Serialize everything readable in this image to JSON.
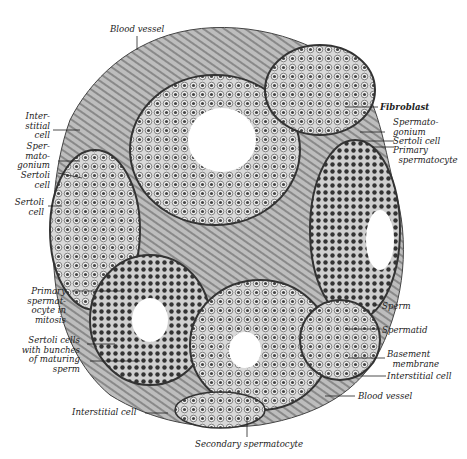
{
  "figure": {
    "labels": {
      "blood_vessel_top": "Blood vessel",
      "interstitial_cell_left": "Inter-\nstitial\ncell",
      "spermatogonium_left": "Sper-\nmato-\ngonium",
      "sertoli_cell_left_1": "Sertoli\ncell",
      "sertoli_cell_left_2": "Sertoli\ncell",
      "fibroblast": "Fibroblast",
      "spermatogonium_right": "Spermato-\ngonium",
      "sertoli_cell_right": "Sertoli cell",
      "primary_spermatocyte": "Primary\n  spermatocyte",
      "primary_spermatocyte_mitosis": "Primary\nspermat-\nocyte in\nmitosis",
      "sertoli_cells_bunches": "Sertoli cells\nwith bunches\nof maturing\nsperm",
      "sperm": "Sperm",
      "spermatid": "Spermatid",
      "basement_membrane": "Basement\n  membrane",
      "interstitial_cell_right": "Interstitial cell",
      "blood_vessel_bottom": "Blood vessel",
      "interstitial_cell_bottom": "Interstitial cell",
      "secondary_spermatocyte": "Secondary spermatocyte"
    }
  }
}
